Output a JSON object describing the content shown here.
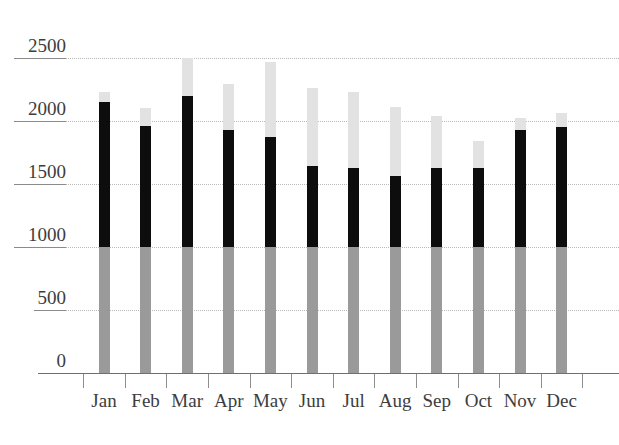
{
  "chart_data": {
    "type": "bar",
    "stacked": true,
    "title": "",
    "subtitle": "",
    "xlabel": "",
    "ylabel": "",
    "categories": [
      "Jan",
      "Feb",
      "Mar",
      "Apr",
      "May",
      "Jun",
      "Jul",
      "Aug",
      "Sep",
      "Oct",
      "Nov",
      "Dec"
    ],
    "ytick_labels": [
      "2500",
      "2000",
      "1500",
      "1000",
      "500",
      "0"
    ],
    "ytick_values": [
      2500,
      2000,
      1500,
      1000,
      500,
      0
    ],
    "ylim": [
      0,
      2600
    ],
    "grid": true,
    "grid_style": "dotted-horizontal",
    "legend": "none",
    "series": [
      {
        "name": "base",
        "color": "#9a9a9a",
        "values": [
          1000,
          1000,
          1000,
          1000,
          1000,
          1000,
          1000,
          1000,
          1000,
          1000,
          1000,
          1000
        ]
      },
      {
        "name": "middle",
        "color": "#0d0d0d",
        "values": [
          1150,
          960,
          1200,
          930,
          875,
          640,
          630,
          560,
          630,
          625,
          925,
          950
        ]
      },
      {
        "name": "top",
        "color": "#e2e2e2",
        "values": [
          80,
          140,
          300,
          360,
          590,
          625,
          600,
          555,
          410,
          215,
          95,
          115
        ]
      }
    ],
    "totals": [
      2230,
      2100,
      2500,
      2290,
      2465,
      2265,
      2230,
      2115,
      2040,
      1840,
      2020,
      2065
    ],
    "segment_tops": {
      "base_top": [
        1000,
        1000,
        1000,
        1000,
        1000,
        1000,
        1000,
        1000,
        1000,
        1000,
        1000,
        1000
      ],
      "middle_top": [
        2150,
        1960,
        2200,
        1930,
        1875,
        1640,
        1630,
        1560,
        1630,
        1625,
        1925,
        1950
      ],
      "bar_top": [
        2230,
        2100,
        2500,
        2290,
        2465,
        2265,
        2230,
        2115,
        2040,
        1840,
        2020,
        2065
      ]
    }
  },
  "colors": {
    "base_segment": "#9a9a9a",
    "middle_segment": "#0d0d0d",
    "top_segment": "#e2e2e2",
    "gridline": "#b9b9b9",
    "axis": "#6f6f6f",
    "text": "#3d3d3d",
    "background": "#ffffff"
  }
}
